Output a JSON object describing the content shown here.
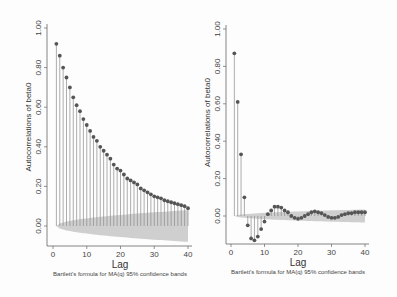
{
  "chart_data": [
    {
      "type": "bar",
      "subtype": "stem (correlogram)",
      "title": "",
      "xlabel": "Lag",
      "ylabel": "Autocorrelations of beta0",
      "caption": "Bartlett's formula for MA(q) 95% confidence bands",
      "xlim": [
        0,
        40
      ],
      "ylim": [
        0,
        1
      ],
      "xticks": [
        "0",
        "10",
        "20",
        "30",
        "40"
      ],
      "yticks": [
        "0.00",
        "0.20",
        "0.40",
        "0.60",
        "0.80",
        "1.00"
      ],
      "grid": false,
      "x": [
        1,
        2,
        3,
        4,
        5,
        6,
        7,
        8,
        9,
        10,
        11,
        12,
        13,
        14,
        15,
        16,
        17,
        18,
        19,
        20,
        21,
        22,
        23,
        24,
        25,
        26,
        27,
        28,
        29,
        30,
        31,
        32,
        33,
        34,
        35,
        36,
        37,
        38,
        39,
        40
      ],
      "values": [
        0.92,
        0.86,
        0.8,
        0.75,
        0.7,
        0.65,
        0.61,
        0.58,
        0.54,
        0.51,
        0.48,
        0.45,
        0.43,
        0.4,
        0.38,
        0.36,
        0.34,
        0.31,
        0.29,
        0.28,
        0.26,
        0.24,
        0.23,
        0.22,
        0.21,
        0.19,
        0.18,
        0.17,
        0.16,
        0.15,
        0.145,
        0.14,
        0.13,
        0.125,
        0.12,
        0.115,
        0.11,
        0.105,
        0.1,
        0.09
      ],
      "confidence_band": {
        "label": "95% confidence band",
        "start_halfwidth": 0.0,
        "end_halfwidth": 0.08
      }
    },
    {
      "type": "bar",
      "subtype": "stem (correlogram)",
      "title": "",
      "xlabel": "Lag",
      "ylabel": "Autocorrelations of beta0",
      "caption": "Bartlett's formula for MA(q) 95% confidence bands",
      "xlim": [
        0,
        40
      ],
      "ylim": [
        -0.15,
        1
      ],
      "xticks": [
        "0",
        "10",
        "20",
        "30",
        "40"
      ],
      "yticks": [
        "0.00",
        "0.20",
        "0.40",
        "0.60",
        "0.80",
        "1.00"
      ],
      "grid": false,
      "x": [
        1,
        2,
        3,
        4,
        5,
        6,
        7,
        8,
        9,
        10,
        11,
        12,
        13,
        14,
        15,
        16,
        17,
        18,
        19,
        20,
        21,
        22,
        23,
        24,
        25,
        26,
        27,
        28,
        29,
        30,
        31,
        32,
        33,
        34,
        35,
        36,
        37,
        38,
        39,
        40
      ],
      "values": [
        0.87,
        0.61,
        0.33,
        0.1,
        -0.05,
        -0.12,
        -0.13,
        -0.11,
        -0.07,
        -0.03,
        0.01,
        0.03,
        0.05,
        0.05,
        0.045,
        0.03,
        0.02,
        0.0,
        -0.01,
        -0.015,
        -0.01,
        0.0,
        0.01,
        0.02,
        0.025,
        0.02,
        0.015,
        0.005,
        -0.005,
        -0.01,
        -0.01,
        -0.005,
        0.005,
        0.01,
        0.015,
        0.015,
        0.02,
        0.02,
        0.02,
        0.02
      ],
      "confidence_band": {
        "label": "95% confidence band",
        "start_halfwidth": 0.0,
        "end_halfwidth": 0.035
      }
    }
  ],
  "colors": {
    "stem": "#8a8a8a",
    "marker": "#555555",
    "band": "#cfcfcf",
    "axis": "#666666"
  }
}
